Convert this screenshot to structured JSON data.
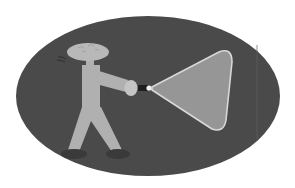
{
  "illustration": {
    "description": "Stick figure holding a flashlight shining a beam of light on a dark oval background",
    "colors": {
      "page_background": "#ffffff",
      "oval_background": "#4a4a4a",
      "figure_body": "#b0b0b0",
      "figure_shoes": "#3a3a3a",
      "flashlight_body": "#1e1e1e",
      "flashlight_bulb": "#f0f0f0",
      "beam_fill": "#969696",
      "beam_edge": "#d8d8d8"
    }
  }
}
